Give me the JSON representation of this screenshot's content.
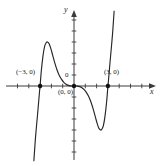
{
  "figure": {
    "type": "math-graph",
    "background": "#ffffff",
    "curve_color": "#262626",
    "axis_color": "#3a3a3a",
    "point_color": "#111111"
  },
  "axes": {
    "x_label": "x",
    "y_label": "y",
    "origin_label": "0",
    "x_range": [
      -6.5,
      6.5
    ],
    "y_range": [
      -6.8,
      6.8
    ],
    "tick_spacing": 1,
    "grid": false,
    "arrow_heads": [
      "x-positive",
      "y-positive"
    ]
  },
  "annotations": [
    {
      "name": "root-negative-three",
      "text": "(−3, 0)",
      "x": -3,
      "y": 0
    },
    {
      "name": "root-origin",
      "text": "(0, 0)",
      "x": 0,
      "y": 0
    },
    {
      "name": "root-positive-three",
      "text": "(3, 0)",
      "x": 3,
      "y": 0
    }
  ],
  "chart_data": {
    "type": "line",
    "title": "",
    "xlabel": "x",
    "ylabel": "y",
    "xlim": [
      -6.5,
      6.5
    ],
    "ylim": [
      -6.8,
      6.8
    ],
    "grid": false,
    "legend": null,
    "series": [
      {
        "name": "curve",
        "description": "odd quintic-like polynomial with zeros at -3, 0 (triple/flat), and 3",
        "x": [
          -3.55,
          -3.4,
          -3.2,
          -3.05,
          -3.0,
          -2.9,
          -2.75,
          -2.6,
          -2.45,
          -2.35,
          -2.2,
          -2.05,
          -1.9,
          -1.7,
          -1.5,
          -1.3,
          -1.1,
          -0.9,
          -0.7,
          -0.5,
          -0.3,
          -0.15,
          0.0,
          0.15,
          0.3,
          0.5,
          0.7,
          0.9,
          1.1,
          1.3,
          1.5,
          1.7,
          1.9,
          2.05,
          2.2,
          2.35,
          2.45,
          2.6,
          2.75,
          2.9,
          3.0,
          3.05,
          3.2,
          3.4,
          3.55
        ],
        "y": [
          -6.8,
          -4.6,
          -2.3,
          -0.5,
          0.0,
          1.3,
          2.7,
          3.6,
          3.95,
          4.0,
          3.85,
          3.4,
          2.85,
          2.1,
          1.45,
          0.95,
          0.6,
          0.33,
          0.16,
          0.06,
          0.013,
          0.002,
          0.0,
          -0.002,
          -0.013,
          -0.06,
          -0.16,
          -0.33,
          -0.6,
          -0.95,
          -1.45,
          -2.1,
          -2.85,
          -3.4,
          -3.85,
          -4.0,
          -3.95,
          -3.6,
          -2.7,
          -1.3,
          0.0,
          0.5,
          2.3,
          4.6,
          6.8
        ]
      }
    ],
    "marked_points": [
      {
        "label": "(−3, 0)",
        "x": -3,
        "y": 0
      },
      {
        "label": "(0, 0)",
        "x": 0,
        "y": 0
      },
      {
        "label": "(3, 0)",
        "x": 3,
        "y": 0
      }
    ],
    "features": {
      "roots": [
        -3,
        0,
        3
      ],
      "local_maximum": {
        "x": -2.35,
        "y": 4.0
      },
      "local_minimum": {
        "x": 2.35,
        "y": -4.0
      },
      "inflection_flat_at": {
        "x": 0,
        "y": 0
      }
    }
  }
}
